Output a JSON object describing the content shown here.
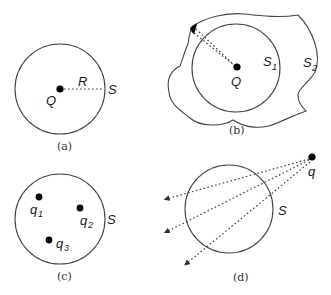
{
  "panels": {
    "a": {
      "caption": "(a)",
      "charge_label": "Q",
      "radius_label": "R",
      "surface_label": "S"
    },
    "b": {
      "caption": "(b)",
      "charge_label": "Q",
      "inner_surface_label": "S",
      "inner_surface_sub": "1",
      "outer_surface_label": "S",
      "outer_surface_sub": "2"
    },
    "c": {
      "caption": "(c)",
      "surface_label": "S",
      "charges": [
        {
          "label": "q",
          "sub": "1"
        },
        {
          "label": "q",
          "sub": "2"
        },
        {
          "label": "q",
          "sub": "3"
        }
      ]
    },
    "d": {
      "caption": "(d)",
      "charge_label": "q",
      "surface_label": "S"
    }
  },
  "colors": {
    "stroke": "#444444",
    "charge": "#000000"
  }
}
